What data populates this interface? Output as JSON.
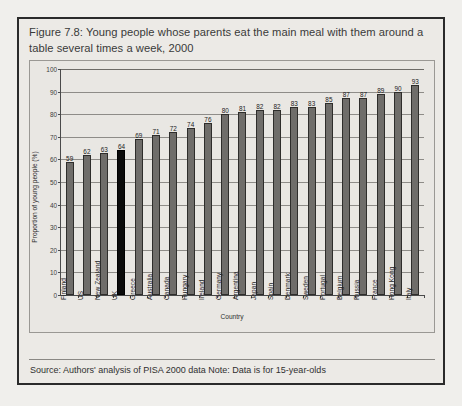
{
  "figure": {
    "title": "Figure 7.8: Young people whose parents eat the main meal with them around a table several times a week, 2000",
    "source_note": "Source: Authors' analysis of PISA 2000 data  Note: Data is for 15-year-olds"
  },
  "chart_data": {
    "type": "bar",
    "title": "Figure 7.8: Young people whose parents eat the main meal with them around a table several times a week, 2000",
    "xlabel": "Country",
    "ylabel": "Proportion of young people (%)",
    "ylim": [
      0,
      100
    ],
    "ytick_step": 10,
    "yticks": [
      "0",
      "10",
      "20",
      "30",
      "40",
      "50",
      "60",
      "70",
      "80",
      "90",
      "100"
    ],
    "grid": true,
    "legend": "none",
    "highlight_category": "UK",
    "highlight_color": "#0b0b0b",
    "bar_color": "#6f6d6a",
    "categories": [
      "Finland",
      "US",
      "New Zealand",
      "UK",
      "Greece",
      "Australia",
      "Canada",
      "Hungary",
      "Ireland",
      "Germany",
      "Argentina",
      "Japan",
      "Spain",
      "Denmark",
      "Sweden",
      "Portugal",
      "Belgium",
      "Russia",
      "France",
      "Hong Kong",
      "Italy"
    ],
    "values": [
      59,
      62,
      63,
      64,
      69,
      71,
      72,
      74,
      76,
      80,
      81,
      82,
      82,
      83,
      83,
      85,
      87,
      87,
      89,
      90,
      93
    ],
    "data_labels": [
      "59",
      "62",
      "63",
      "64",
      "69",
      "71",
      "72",
      "74",
      "76",
      "80",
      "81",
      "82",
      "82",
      "83",
      "83",
      "85",
      "87",
      "87",
      "89",
      "90",
      "93"
    ]
  }
}
